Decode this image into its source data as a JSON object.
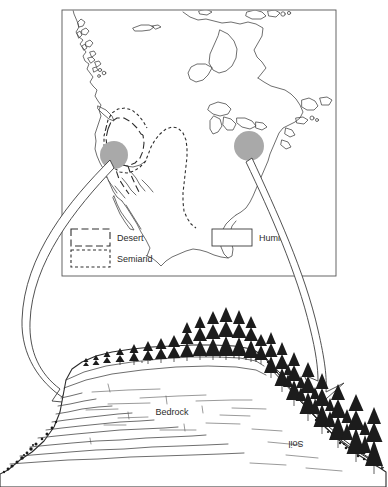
{
  "figure": {
    "map_panel": {
      "name": "north-america-climate-map",
      "frame": {
        "x": 62,
        "y": 10,
        "w": 274,
        "h": 266
      },
      "hotspots": [
        {
          "name": "arid-site-marker",
          "label": "",
          "cx": 114,
          "cy": 155,
          "r": 14,
          "color": "#a9a9a9"
        },
        {
          "name": "humid-site-marker",
          "label": "",
          "cx": 249,
          "cy": 146,
          "r": 15,
          "color": "#a9a9a9"
        }
      ],
      "legend": {
        "name": "climate-legend",
        "entries": [
          {
            "key": "desert",
            "label": "Desert",
            "style": "long-dashed"
          },
          {
            "key": "semiarid",
            "label": "Semiarid",
            "style": "short-dashed"
          },
          {
            "key": "humid",
            "label": "Humid",
            "style": "solid"
          }
        ]
      }
    },
    "landscape_panel": {
      "name": "cross-section-landscape",
      "labels": [
        {
          "key": "bedrock",
          "text": "Bedrock",
          "x": 172,
          "y": 415,
          "rotation": 0
        },
        {
          "key": "soil",
          "text": "Soil",
          "x": 296,
          "y": 441,
          "rotation": 180
        }
      ],
      "arrows": [
        {
          "key": "arrow-to-arid",
          "from": "arid-site-marker",
          "to": "left-escarpment"
        },
        {
          "key": "arrow-to-humid",
          "from": "humid-site-marker",
          "to": "right-forested-slope"
        }
      ]
    },
    "colors": {
      "ink": "#2b2b2b",
      "line": "#4a4a4a",
      "hotspot_gray": "#a9a9a9",
      "paper": "#ffffff"
    }
  }
}
